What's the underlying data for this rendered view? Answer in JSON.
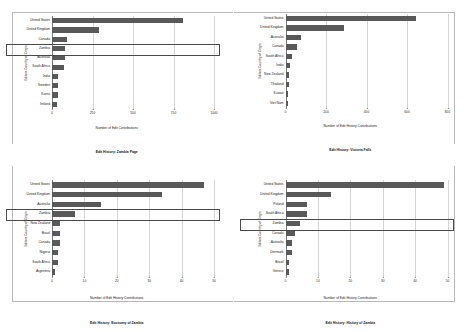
{
  "figure": {
    "panels": [
      "top-left",
      "top-right",
      "bottom-left",
      "bottom-right"
    ],
    "highlight_color": "#4a4a4a",
    "bar_color": "#595959",
    "grid_color": "#d5d5d5"
  },
  "chart_data": [
    {
      "id": "zambia-page",
      "type": "bar",
      "orientation": "horizontal",
      "title": "Edit History: Zambia Page",
      "xlabel": "Number of Edit Contributions",
      "ylabel": "Editors Country of Origin",
      "xlim": [
        0,
        1000
      ],
      "xticks": [
        "0",
        "250",
        "500",
        "750",
        "1000"
      ],
      "grid": true,
      "categories": [
        "United States",
        "United Kingdom",
        "Canada",
        "Zambia",
        "Australia",
        "South Africa",
        "India",
        "Sweden",
        "Korea",
        "Ireland"
      ],
      "values": [
        810,
        290,
        95,
        80,
        78,
        72,
        40,
        38,
        35,
        33
      ],
      "highlighted_category": "Zambia"
    },
    {
      "id": "victoria-falls",
      "type": "bar",
      "orientation": "horizontal",
      "title": "Edit History: Victoria Falls",
      "xlabel": "Number of Edit History Contributions",
      "ylabel": "Editors Country of Origin",
      "xlim": [
        0,
        800
      ],
      "xticks": [
        "0",
        "200",
        "400",
        "600",
        "800"
      ],
      "grid": true,
      "categories": [
        "United States",
        "United Kingdom",
        "Australia",
        "Canada",
        "South Africa",
        "India",
        "New Zealand",
        "Thailand",
        "Kuwait",
        "Viet Nam"
      ],
      "values": [
        645,
        290,
        75,
        55,
        32,
        22,
        17,
        16,
        14,
        13
      ],
      "highlighted_category": null
    },
    {
      "id": "economy-of-zambia",
      "type": "bar",
      "orientation": "horizontal",
      "title": "Edit History: Economy of Zambia",
      "xlabel": "Number of Edit History Contributions",
      "ylabel": "Editors Country of Origin",
      "xlim": [
        0,
        50
      ],
      "xticks": [
        "0",
        "10",
        "20",
        "30",
        "40",
        "50"
      ],
      "grid": true,
      "categories": [
        "United States",
        "United Kingdom",
        "Australia",
        "Zambia",
        "New Zealand",
        "Brazil",
        "Canada",
        "Nigeria",
        "South Africa",
        "Argentina"
      ],
      "values": [
        47,
        34,
        15,
        7,
        2.5,
        2.5,
        2.5,
        1.8,
        1.8,
        1
      ],
      "highlighted_category": "Zambia"
    },
    {
      "id": "history-of-zambia",
      "type": "bar",
      "orientation": "horizontal",
      "title": "Edit History: History of Zambia",
      "xlabel": "Number of Edit History Contributions",
      "ylabel": "Editors Country of Origin",
      "xlim": [
        0,
        50
      ],
      "xticks": [
        "0",
        "10",
        "20",
        "30",
        "40",
        "50"
      ],
      "grid": true,
      "categories": [
        "United States",
        "United Kingdom",
        "Poland",
        "South Africa",
        "Zambia",
        "Canada",
        "Australia",
        "Denmark",
        "Brazil",
        "Greece"
      ],
      "values": [
        49,
        14,
        6.5,
        6.5,
        4.5,
        3,
        2,
        2,
        1,
        1
      ],
      "highlighted_category": "Zambia"
    }
  ]
}
